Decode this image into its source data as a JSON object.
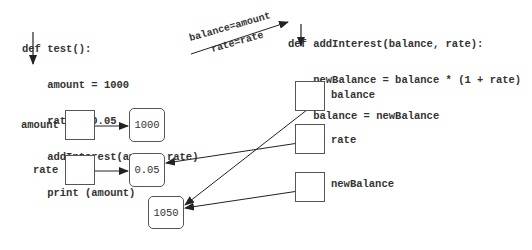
{
  "caller": {
    "lines": [
      "def test():",
      "    amount = 1000",
      "    rate = 0.05",
      "    addInterest(amount,rate)",
      "    print (amount)"
    ]
  },
  "callee": {
    "lines": [
      "def addInterest(balance, rate):",
      "    newBalance = balance * (1 + rate)",
      "    balance = newBalance"
    ]
  },
  "binding": {
    "top": "balance=amount",
    "bottom": "rate=rate"
  },
  "left_vars": [
    {
      "name": "amount",
      "value": "1000"
    },
    {
      "name": "rate",
      "value": "0.05"
    }
  ],
  "right_vars": [
    {
      "name": "balance"
    },
    {
      "name": "rate"
    },
    {
      "name": "newBalance"
    }
  ],
  "result_value": "1050"
}
